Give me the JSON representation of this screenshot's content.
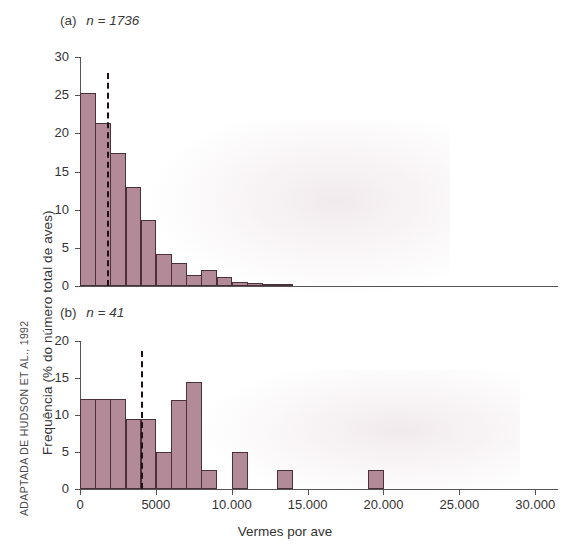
{
  "figure": {
    "credit": "ADAPTADA DE HUDSON ET AL., 1992",
    "y_axis_label": "Frequência (% do número total de aves)",
    "x_axis_label": "Vermes por ave",
    "bar_color": "#b38b98",
    "bar_edge_color": "#4a3138",
    "dashed_line_color": "#1d1117"
  },
  "panels": [
    {
      "id": "a",
      "title": "(a)  n = 1736",
      "tag": "(a)",
      "n_label": "n = 1736",
      "n": 1736
    },
    {
      "id": "b",
      "title": "(b)  n = 41",
      "tag": "(b)",
      "n_label": "n = 41",
      "n": 41
    }
  ],
  "chart_data": [
    {
      "type": "bar",
      "panel": "a",
      "title": "(a) n = 1736",
      "xlabel": "Vermes por ave",
      "ylabel": "Frequência (% do número total de aves)",
      "xlim": [
        0,
        31500
      ],
      "ylim": [
        0,
        30
      ],
      "yticks": [
        0,
        5,
        10,
        15,
        20,
        25,
        30
      ],
      "ytick_labels": [
        "0",
        "5",
        "10",
        "15",
        "20",
        "25",
        "30"
      ],
      "xticks": [],
      "xtick_labels": [],
      "grid": false,
      "legend": null,
      "bin_width": 1000,
      "bin_starts": [
        0,
        1000,
        2000,
        3000,
        4000,
        5000,
        6000,
        7000,
        8000,
        9000,
        10000,
        11000,
        12000,
        13000
      ],
      "categories": [
        "0-1000",
        "1000-2000",
        "2000-3000",
        "3000-4000",
        "4000-5000",
        "5000-6000",
        "6000-7000",
        "7000-8000",
        "8000-9000",
        "9000-10000",
        "10000-11000",
        "11000-12000",
        "12000-13000",
        "13000-14000"
      ],
      "values": [
        25.3,
        21.4,
        17.4,
        13.0,
        8.7,
        4.2,
        3.0,
        1.5,
        2.1,
        1.2,
        0.5,
        0.4,
        0.3,
        0.3
      ],
      "annotations": [
        {
          "type": "vline",
          "style": "dashed",
          "x": 1800,
          "label": "média"
        }
      ]
    },
    {
      "type": "bar",
      "panel": "b",
      "title": "(b) n = 41",
      "xlabel": "Vermes por ave",
      "ylabel": "Frequência (% do número total de aves)",
      "xlim": [
        0,
        31500
      ],
      "ylim": [
        0,
        20
      ],
      "yticks": [
        0,
        5,
        10,
        15,
        20
      ],
      "ytick_labels": [
        "0",
        "5",
        "10",
        "15",
        "20"
      ],
      "xticks": [
        0,
        5000,
        10000,
        15000,
        20000,
        25000,
        30000
      ],
      "xtick_labels": [
        "0",
        "5000",
        "10.000",
        "15.000",
        "20.000",
        "25.000",
        "30.000"
      ],
      "grid": false,
      "legend": null,
      "bin_width": 1000,
      "bin_starts": [
        0,
        1000,
        2000,
        3000,
        4000,
        5000,
        6000,
        7000,
        8000,
        10000,
        13000,
        19000
      ],
      "categories": [
        "0-1000",
        "1000-2000",
        "2000-3000",
        "3000-4000",
        "4000-5000",
        "5000-6000",
        "6000-7000",
        "7000-8000",
        "8000-9000",
        "10000-11000",
        "13000-14000",
        "19000-20000"
      ],
      "values": [
        12.2,
        12.2,
        12.2,
        9.5,
        9.5,
        5.0,
        12.0,
        14.5,
        2.6,
        5.0,
        2.6,
        2.6
      ],
      "annotations": [
        {
          "type": "vline",
          "style": "dashed",
          "x": 4000,
          "label": "média"
        }
      ]
    }
  ]
}
